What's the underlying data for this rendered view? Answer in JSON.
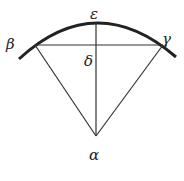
{
  "diagram": {
    "type": "geometry-sector",
    "labels": {
      "alpha": "α",
      "beta": "β",
      "gamma": "γ",
      "delta": "δ",
      "epsilon": "ε"
    },
    "points": {
      "alpha": [
        96,
        136
      ],
      "beta": [
        35,
        45
      ],
      "gamma": [
        163,
        45
      ],
      "delta": [
        96,
        45
      ],
      "epsilon": [
        96,
        22
      ]
    },
    "colors": {
      "line": "#222222",
      "background": "#ffffff"
    }
  }
}
